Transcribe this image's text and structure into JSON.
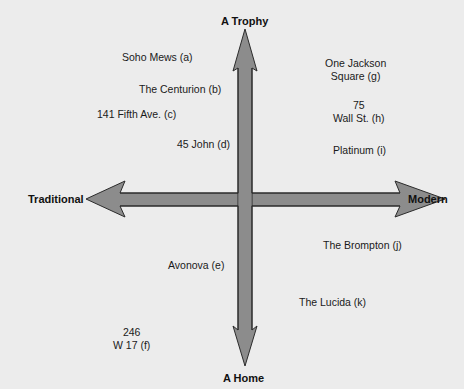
{
  "axes": {
    "top": "A Trophy",
    "bottom": "A Home",
    "left": "Traditional",
    "right": "Modern"
  },
  "colors": {
    "background": "#ececec",
    "arrow_fill": "#8c8c8c",
    "arrow_stroke": "#2b2b2b",
    "text": "#1a1a1a"
  },
  "items": [
    {
      "id": "a",
      "lines": [
        "Soho Mews (a)"
      ]
    },
    {
      "id": "b",
      "lines": [
        "The Centurion (b)"
      ]
    },
    {
      "id": "c",
      "lines": [
        "141 Fifth Ave. (c)"
      ]
    },
    {
      "id": "d",
      "lines": [
        "45 John (d)"
      ]
    },
    {
      "id": "e",
      "lines": [
        "Avonova (e)"
      ]
    },
    {
      "id": "f",
      "lines": [
        "246",
        "W 17 (f)"
      ]
    },
    {
      "id": "g",
      "lines": [
        "One Jackson",
        "Square (g)"
      ]
    },
    {
      "id": "h",
      "lines": [
        "75",
        "Wall St. (h)"
      ]
    },
    {
      "id": "i",
      "lines": [
        "Platinum (i)"
      ]
    },
    {
      "id": "j",
      "lines": [
        "The Brompton (j)"
      ]
    },
    {
      "id": "k",
      "lines": [
        "The Lucida (k)"
      ]
    }
  ]
}
